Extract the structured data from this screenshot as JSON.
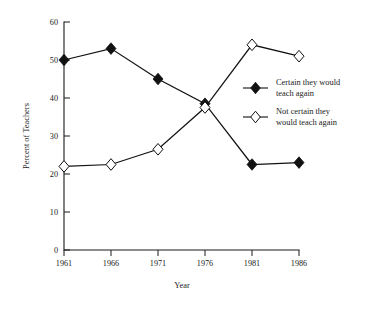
{
  "chart_data": {
    "type": "line",
    "title": "",
    "subtitle": "",
    "xlabel": "Year",
    "ylabel": "Percent of Teachers",
    "categories": [
      "1961",
      "1966",
      "1971",
      "1976",
      "1981",
      "1986"
    ],
    "x": [
      1961,
      1966,
      1971,
      1976,
      1981,
      1986
    ],
    "xlim": [
      1961,
      1986
    ],
    "ylim": [
      0,
      60
    ],
    "yticks": [
      0,
      10,
      20,
      30,
      40,
      50,
      60
    ],
    "ytick_labels": [
      "0",
      "10",
      "20",
      "30",
      "40",
      "50",
      "60"
    ],
    "xtick_labels": [
      "1961",
      "1966",
      "1971",
      "1976",
      "1981",
      "1986"
    ],
    "grid": false,
    "legend_position": "right-middle",
    "series": [
      {
        "name": "Certain they would teach again",
        "marker": "filled-diamond",
        "color": "#111111",
        "values": [
          50,
          53,
          45,
          38.5,
          22.5,
          23
        ]
      },
      {
        "name": "Not certain they would teach again",
        "marker": "open-diamond",
        "color": "#111111",
        "values": [
          22,
          22.5,
          26.5,
          37.5,
          54,
          51
        ]
      }
    ]
  },
  "legend": {
    "entries": [
      {
        "label_line1": "Certain they would",
        "label_line2": "teach again",
        "marker": "filled-diamond"
      },
      {
        "label_line1": "Not certain they",
        "label_line2": "would teach again",
        "marker": "open-diamond"
      }
    ]
  },
  "axes": {
    "y_title": "Percent of Teachers",
    "x_title": "Year",
    "y_labels": [
      "60",
      "50",
      "40",
      "30",
      "20",
      "10",
      "0"
    ],
    "x_labels": [
      "1961",
      "1966",
      "1971",
      "1976",
      "1981",
      "1986"
    ]
  }
}
